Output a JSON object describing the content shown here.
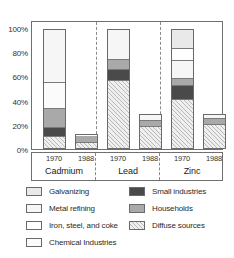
{
  "chart_data": {
    "type": "bar",
    "title": "",
    "xlabel": "",
    "ylabel": "",
    "ylim": [
      0,
      100
    ],
    "grid": false,
    "legend_position": "bottom",
    "stacked": true,
    "categories": [
      "Cadmium 1970",
      "Cadmium 1988",
      "Lead 1970",
      "Lead 1988",
      "Zinc 1970",
      "Zinc 1988"
    ],
    "groups": [
      {
        "name": "Cadmium",
        "years": [
          "1970",
          "1988"
        ]
      },
      {
        "name": "Lead",
        "years": [
          "1970",
          "1988"
        ]
      },
      {
        "name": "Zinc",
        "years": [
          "1970",
          "1988"
        ]
      }
    ],
    "y_ticks": [
      "0%",
      "20%",
      "40%",
      "60%",
      "80%",
      "100%"
    ],
    "y_tick_values": [
      0,
      20,
      40,
      60,
      80,
      100
    ],
    "series": [
      {
        "name": "Diffuse sources",
        "key": "diffuse",
        "values": [
          9,
          5,
          56,
          18,
          40,
          20
        ]
      },
      {
        "name": "Small industries",
        "key": "small",
        "values": [
          8,
          0,
          10,
          0,
          12,
          0
        ]
      },
      {
        "name": "Households",
        "key": "households",
        "values": [
          16,
          7,
          8,
          6,
          6,
          5
        ]
      },
      {
        "name": "Iron, steel, and coke",
        "key": "iron",
        "values": [
          0,
          0,
          0,
          0,
          10,
          0
        ]
      },
      {
        "name": "Chemical Industries",
        "key": "chemical",
        "values": [
          22,
          0,
          0,
          0,
          0,
          0
        ]
      },
      {
        "name": "Metal refining",
        "key": "metal",
        "values": [
          44,
          0,
          25,
          5,
          15,
          4
        ]
      },
      {
        "name": "Galvanizing",
        "key": "galvanizing",
        "values": [
          0,
          0,
          0,
          0,
          16,
          0
        ]
      }
    ],
    "bars": [
      {
        "id": "cadmium-1970",
        "group": "Cadmium",
        "year": "1970",
        "total": 99,
        "segments": [
          {
            "key": "diffuse",
            "label": "Diffuse sources",
            "value": 9
          },
          {
            "key": "small",
            "label": "Small industries",
            "value": 8
          },
          {
            "key": "households",
            "label": "Households",
            "value": 16
          },
          {
            "key": "chemical",
            "label": "Chemical Industries",
            "value": 22
          },
          {
            "key": "metal",
            "label": "Metal refining",
            "value": 44
          }
        ]
      },
      {
        "id": "cadmium-1988",
        "group": "Cadmium",
        "year": "1988",
        "total": 12,
        "segments": [
          {
            "key": "diffuse",
            "label": "Diffuse sources",
            "value": 5
          },
          {
            "key": "households",
            "label": "Households",
            "value": 7
          }
        ]
      },
      {
        "id": "lead-1970",
        "group": "Lead",
        "year": "1970",
        "total": 99,
        "segments": [
          {
            "key": "diffuse",
            "label": "Diffuse sources",
            "value": 56
          },
          {
            "key": "small",
            "label": "Small industries",
            "value": 10
          },
          {
            "key": "households",
            "label": "Households",
            "value": 8
          },
          {
            "key": "metal",
            "label": "Metal refining",
            "value": 25
          }
        ]
      },
      {
        "id": "lead-1988",
        "group": "Lead",
        "year": "1988",
        "total": 29,
        "segments": [
          {
            "key": "diffuse",
            "label": "Diffuse sources",
            "value": 18
          },
          {
            "key": "households",
            "label": "Households",
            "value": 6
          },
          {
            "key": "metal",
            "label": "Metal refining",
            "value": 5
          }
        ]
      },
      {
        "id": "zinc-1970",
        "group": "Zinc",
        "year": "1970",
        "total": 99,
        "segments": [
          {
            "key": "diffuse",
            "label": "Diffuse sources",
            "value": 40
          },
          {
            "key": "small",
            "label": "Small industries",
            "value": 12
          },
          {
            "key": "households",
            "label": "Households",
            "value": 6
          },
          {
            "key": "metal",
            "label": "Metal refining",
            "value": 15
          },
          {
            "key": "iron",
            "label": "Iron, steel, and coke",
            "value": 10
          },
          {
            "key": "galvanizing",
            "label": "Galvanizing",
            "value": 16
          }
        ]
      },
      {
        "id": "zinc-1988",
        "group": "Zinc",
        "year": "1988",
        "total": 29,
        "segments": [
          {
            "key": "diffuse",
            "label": "Diffuse sources",
            "value": 20
          },
          {
            "key": "households",
            "label": "Households",
            "value": 5
          },
          {
            "key": "metal",
            "label": "Metal refining",
            "value": 4
          }
        ]
      }
    ],
    "legend": {
      "left_column": [
        {
          "key": "galvanizing",
          "label": "Galvanizing"
        },
        {
          "key": "metal",
          "label": "Metal refining"
        },
        {
          "key": "iron",
          "label": "Iron, steel, and coke"
        },
        {
          "key": "chemical",
          "label": "Chemical Industries"
        }
      ],
      "right_column": [
        {
          "key": "small",
          "label": "Small industries"
        },
        {
          "key": "households",
          "label": "Households"
        },
        {
          "key": "diffuse",
          "label": "Diffuse sources"
        }
      ]
    },
    "colors": {
      "galvanizing": "#e9e9e9",
      "metal": "#f6f6f6",
      "iron": "#ffffff",
      "chemical": "#fbfbfb",
      "small": "#4a4a4a",
      "households": "#a9a9a9",
      "diffuse": "#efefef",
      "axis": "#6f6f6f",
      "text": "#2b2b2b"
    }
  }
}
